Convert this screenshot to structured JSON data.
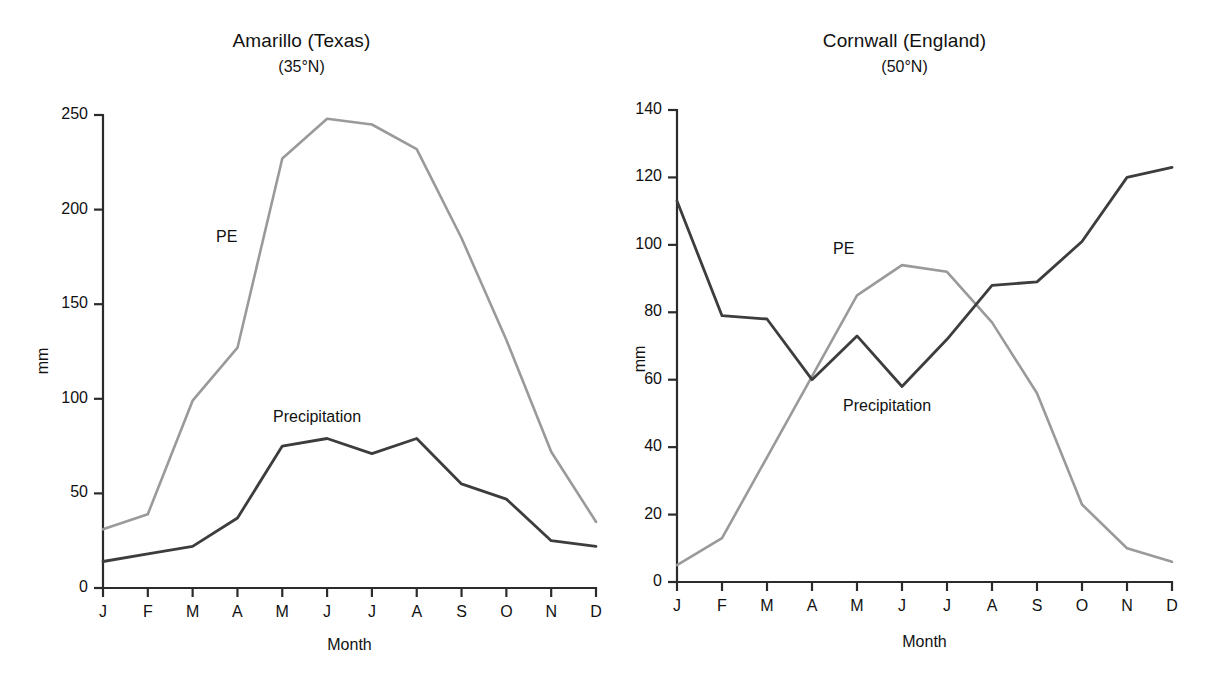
{
  "figure": {
    "panels": [
      {
        "id": "amarillo",
        "title": "Amarillo (Texas)",
        "subtitle": "(35°N)",
        "ylabel": "mm",
        "xlabel": "Month",
        "pe_label": "PE",
        "precip_label": "Precipitation",
        "ytick_labels": [
          "0",
          "50",
          "100",
          "150",
          "200",
          "250"
        ],
        "xtick_labels": [
          "J",
          "F",
          "M",
          "A",
          "M",
          "J",
          "J",
          "A",
          "S",
          "O",
          "N",
          "D"
        ]
      },
      {
        "id": "cornwall",
        "title": "Cornwall (England)",
        "subtitle": "(50°N)",
        "ylabel": "mm",
        "xlabel": "Month",
        "pe_label": "PE",
        "precip_label": "Precipitation",
        "ytick_labels": [
          "0",
          "20",
          "40",
          "60",
          "80",
          "100",
          "120",
          "140"
        ],
        "xtick_labels": [
          "J",
          "F",
          "M",
          "A",
          "M",
          "J",
          "J",
          "A",
          "S",
          "O",
          "N",
          "D"
        ]
      }
    ]
  },
  "colors": {
    "pe_line": "#9a9a9a",
    "precip_line": "#3d3d3d",
    "axis": "#2b2b2b",
    "text": "#111111",
    "background": "#ffffff"
  },
  "chart_data": [
    {
      "type": "line",
      "title": "Amarillo (Texas)",
      "subtitle": "(35°N)",
      "xlabel": "Month",
      "ylabel": "mm",
      "categories": [
        "J",
        "F",
        "M",
        "A",
        "M",
        "J",
        "J",
        "A",
        "S",
        "O",
        "N",
        "D"
      ],
      "ylim": [
        0,
        250
      ],
      "yticks": [
        0,
        50,
        100,
        150,
        200,
        250
      ],
      "grid": false,
      "legend": "inline-annotations",
      "series": [
        {
          "name": "PE",
          "color": "#9a9a9a",
          "values": [
            31,
            39,
            99,
            127,
            227,
            248,
            245,
            232,
            185,
            131,
            72,
            35
          ]
        },
        {
          "name": "Precipitation",
          "color": "#3d3d3d",
          "values": [
            14,
            18,
            22,
            37,
            75,
            79,
            71,
            79,
            55,
            47,
            25,
            22
          ]
        }
      ]
    },
    {
      "type": "line",
      "title": "Cornwall (England)",
      "subtitle": "(50°N)",
      "xlabel": "Month",
      "ylabel": "mm",
      "categories": [
        "J",
        "F",
        "M",
        "A",
        "M",
        "J",
        "J",
        "A",
        "S",
        "O",
        "N",
        "D"
      ],
      "ylim": [
        0,
        140
      ],
      "yticks": [
        0,
        20,
        40,
        60,
        80,
        100,
        120,
        140
      ],
      "grid": false,
      "legend": "inline-annotations",
      "series": [
        {
          "name": "PE",
          "color": "#9a9a9a",
          "values": [
            5,
            13,
            37,
            61,
            85,
            94,
            92,
            77,
            56,
            23,
            10,
            6
          ]
        },
        {
          "name": "Precipitation",
          "color": "#3d3d3d",
          "values": [
            113,
            79,
            78,
            60,
            73,
            58,
            72,
            88,
            89,
            101,
            120,
            123
          ]
        }
      ]
    }
  ]
}
